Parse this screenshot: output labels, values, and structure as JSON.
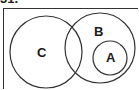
{
  "question": {
    "number": "31."
  },
  "diagram": {
    "type": "venn",
    "universe": {
      "x": 3.5,
      "y": 8.5,
      "width": 140,
      "height": 90
    },
    "stroke_color": "#333333",
    "sets": [
      {
        "label": "C",
        "cx": 46,
        "cy": 52,
        "r": 36,
        "label_x": 37,
        "label_y": 57
      },
      {
        "label": "B",
        "cx": 100,
        "cy": 48,
        "r": 35,
        "label_x": 94,
        "label_y": 36
      },
      {
        "label": "A",
        "cx": 110,
        "cy": 58,
        "r": 17,
        "label_x": 111,
        "label_y": 62
      }
    ],
    "relationships": [
      "A is a subset of B",
      "B and C overlap",
      "A and C are disjoint"
    ]
  }
}
